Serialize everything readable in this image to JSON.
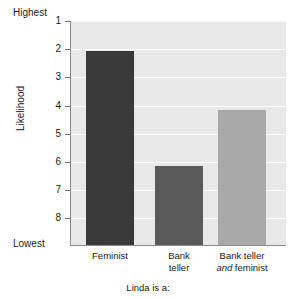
{
  "chart_data": {
    "type": "bar",
    "title": "",
    "subtitle": "",
    "xlabel": "Linda is a:",
    "ylabel": "Likelihood",
    "categories": [
      "Feminist",
      "Bank teller",
      "Bank teller and feminist"
    ],
    "values": [
      2.05,
      6.15,
      4.15
    ],
    "series": [
      {
        "name": "Mean rank",
        "values": [
          2.05,
          6.15,
          4.15
        ]
      }
    ],
    "ylim": [
      1,
      8
    ],
    "y_axis_inverted": true,
    "y_tick_labels": [
      "1",
      "2",
      "3",
      "4",
      "5",
      "6",
      "7",
      "8"
    ],
    "y_tick_values": [
      1,
      2,
      3,
      4,
      5,
      6,
      7,
      8
    ],
    "y_axis_top_annotation": "Highest",
    "y_axis_bottom_annotation": "Lowest",
    "grid": true,
    "legend": false,
    "legend_position": "none",
    "bar_colors": [
      "#3a3a3a",
      "#5a5a5a",
      "#a8a8a8"
    ],
    "plot_background": "#e8e8e8",
    "gridline_color": "#fbfbfb",
    "axis_color": "#8a8a8a",
    "figure_background": "#ffffff"
  },
  "axis": {
    "y_title": "Likelihood",
    "x_title": "Linda is a:",
    "highest_label": "Highest",
    "lowest_label": "Lowest",
    "ticks": [
      {
        "label": "1"
      },
      {
        "label": "2"
      },
      {
        "label": "3"
      },
      {
        "label": "4"
      },
      {
        "label": "5"
      },
      {
        "label": "6"
      },
      {
        "label": "7"
      },
      {
        "label": "8"
      }
    ]
  },
  "categories": [
    {
      "line1": "Feminist",
      "line2": "",
      "emphasis": ""
    },
    {
      "line1": "Bank",
      "line2": "teller",
      "emphasis": ""
    },
    {
      "line1": "Bank teller",
      "line2": " feminist",
      "emphasis": "and"
    }
  ]
}
